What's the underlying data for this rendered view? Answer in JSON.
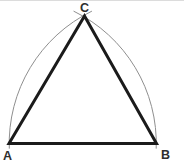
{
  "figure": {
    "figure_type": "equilateral-triangle-compass-construction",
    "labels": {
      "vertex_a": "A",
      "vertex_b": "B",
      "vertex_c": "C"
    },
    "colors": {
      "background": "#ffffff",
      "triangle_stroke": "#1b1b1b",
      "arc_stroke": "#8f8f8f",
      "label_color": "#2e2e2e",
      "top_border": "#dcdcdc"
    },
    "geometry": {
      "canvas": {
        "width": 184,
        "height": 162
      },
      "triangle": {
        "points": [
          [
            9,
            143.5
          ],
          [
            84.5,
            16
          ],
          [
            156.5,
            143.5
          ]
        ],
        "stroke_width": 3
      },
      "arcs": [
        {
          "name": "arc-centered-b",
          "center": [
            156.5,
            143.5
          ],
          "radius": 147.3,
          "start_deg": 178,
          "end_deg": 244,
          "stroke_width": 1
        },
        {
          "name": "arc-centered-a",
          "center": [
            9,
            143.5
          ],
          "radius": 147.3,
          "start_deg": 2,
          "end_deg": -64,
          "stroke_width": 1
        }
      ],
      "label_positions": {
        "a": [
          7.5,
          160
        ],
        "b": [
          165.5,
          159
        ],
        "c": [
          84.5,
          12
        ]
      }
    }
  }
}
